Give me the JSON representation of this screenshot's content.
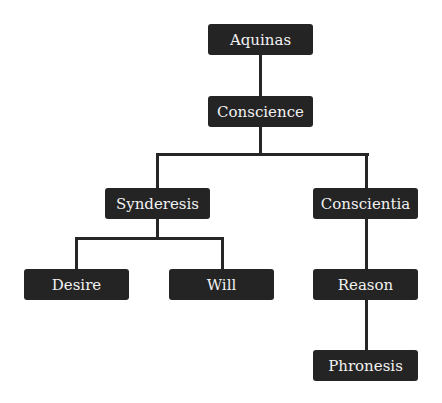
{
  "diagram": {
    "colors": {
      "node_bg": "#242424",
      "node_text": "#f2f2f2",
      "edge": "#262626",
      "background": "#ffffff"
    },
    "nodes": {
      "aquinas": {
        "label": "Aquinas"
      },
      "conscience": {
        "label": "Conscience"
      },
      "synderesis": {
        "label": "Synderesis"
      },
      "conscientia": {
        "label": "Conscientia"
      },
      "desire": {
        "label": "Desire"
      },
      "will": {
        "label": "Will"
      },
      "reason": {
        "label": "Reason"
      },
      "phronesis": {
        "label": "Phronesis"
      }
    },
    "edges": [
      [
        "Aquinas",
        "Conscience"
      ],
      [
        "Conscience",
        "Synderesis"
      ],
      [
        "Conscience",
        "Conscientia"
      ],
      [
        "Synderesis",
        "Desire"
      ],
      [
        "Synderesis",
        "Will"
      ],
      [
        "Conscientia",
        "Reason"
      ],
      [
        "Reason",
        "Phronesis"
      ]
    ]
  }
}
